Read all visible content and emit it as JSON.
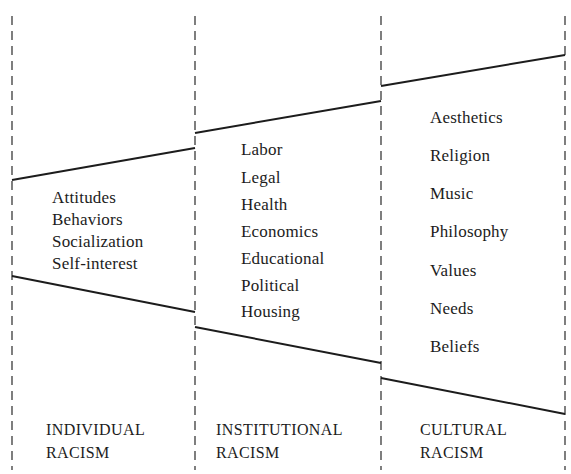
{
  "diagram": {
    "type": "three-panel funnel diagram",
    "panels": [
      {
        "id": "individual",
        "title_line1": "INDIVIDUAL",
        "title_line2": "RACISM",
        "items": [
          "Attitudes",
          "Behaviors",
          "Socialization",
          "Self-interest"
        ]
      },
      {
        "id": "institutional",
        "title_line1": "INSTITUTIONAL",
        "title_line2": "RACISM",
        "items": [
          "Labor",
          "Legal",
          "Health",
          "Economics",
          "Educational",
          "Political",
          "Housing"
        ]
      },
      {
        "id": "cultural",
        "title_line1": "CULTURAL",
        "title_line2": "RACISM",
        "items": [
          "Aesthetics",
          "Religion",
          "Music",
          "Philosophy",
          "Values",
          "Needs",
          "Beliefs"
        ]
      }
    ],
    "colors": {
      "line": "#1c1c1c",
      "background": "#ffffff"
    }
  }
}
